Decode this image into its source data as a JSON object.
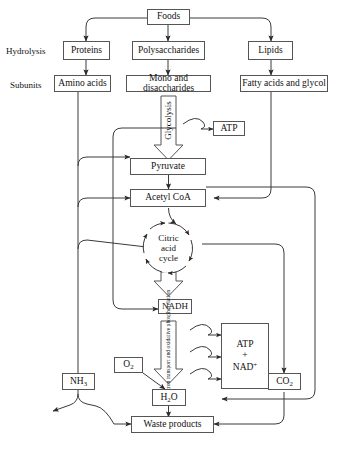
{
  "diagram": {
    "stage_labels": {
      "hydrolysis": "Hydrolysis",
      "subunits": "Subunits"
    },
    "nodes": {
      "foods": "Foods",
      "proteins": "Proteins",
      "polysaccharides": "Polysaccharides",
      "lipids": "Lipids",
      "amino_acids": "Amino acids",
      "mono_disaccharides": "Mono and disaccharides",
      "fatty_acids": "Fatty acids and glycol",
      "glycolysis": "Glycolysis",
      "atp_glycolysis": "ATP",
      "pyruvate": "Pyruvate",
      "acetyl_coa": "Acetyl CoA",
      "citric_acid_cycle_l1": "Citric",
      "citric_acid_cycle_l2": "acid",
      "citric_acid_cycle_l3": "cycle",
      "nadh": "NADH",
      "electron_transport": "Electron transport and oxidative phosphorylation",
      "atp_nad_l1": "ATP",
      "atp_nad_l2": "+",
      "atp_nad_l3_base": "NAD",
      "atp_nad_l3_sup": "+",
      "oxygen_base": "O",
      "oxygen_sub": "2",
      "water_base_1": "H",
      "water_sub": "2",
      "water_base_2": "O",
      "ammonia_base": "NH",
      "ammonia_sub": "3",
      "carbon_dioxide_base": "CO",
      "carbon_dioxide_sub": "2",
      "waste_products": "Waste products"
    },
    "colors": {
      "stroke": "#555555",
      "line": "#3a3a3a",
      "background": "#ffffff",
      "text": "#111111"
    }
  }
}
